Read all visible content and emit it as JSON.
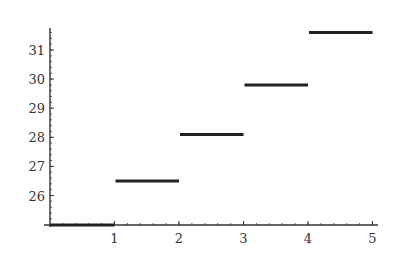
{
  "chart_data": {
    "type": "line",
    "subtype": "step",
    "title": "",
    "xlabel": "",
    "ylabel": "",
    "x_ticks": [
      1,
      2,
      3,
      4,
      5
    ],
    "y_ticks": [
      26,
      27,
      28,
      29,
      30,
      31
    ],
    "xlim": [
      0,
      5.1
    ],
    "ylim": [
      25,
      31.8
    ],
    "grid": false,
    "legend": null,
    "segments": [
      {
        "x_start": 0,
        "x_end": 1,
        "y": 25
      },
      {
        "x_start": 1,
        "x_end": 2,
        "y": 26.5
      },
      {
        "x_start": 2,
        "x_end": 3,
        "y": 28.1
      },
      {
        "x_start": 3,
        "x_end": 4,
        "y": 29.8
      },
      {
        "x_start": 4,
        "x_end": 5,
        "y": 31.6
      }
    ],
    "series": [
      {
        "name": "step",
        "x": [
          0.5,
          1.5,
          2.5,
          3.5,
          4.5
        ],
        "values": [
          25,
          26.5,
          28.1,
          29.8,
          31.6
        ]
      }
    ],
    "line_color": "#222222",
    "axis_color": "#333333"
  }
}
